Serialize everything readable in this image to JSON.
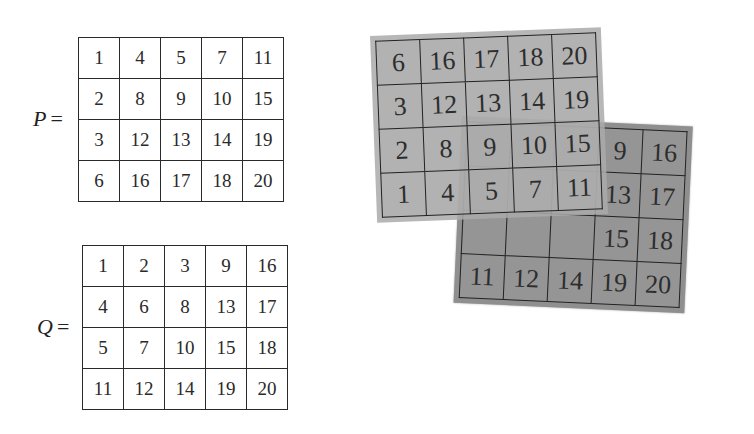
{
  "matrices": {
    "P": {
      "label": "P",
      "equals": "=",
      "rows": [
        [
          "1",
          "4",
          "5",
          "7",
          "11"
        ],
        [
          "2",
          "8",
          "9",
          "10",
          "15"
        ],
        [
          "3",
          "12",
          "13",
          "14",
          "19"
        ],
        [
          "6",
          "16",
          "17",
          "18",
          "20"
        ]
      ]
    },
    "Q": {
      "label": "Q",
      "equals": "=",
      "rows": [
        [
          "1",
          "2",
          "3",
          "9",
          "16"
        ],
        [
          "4",
          "6",
          "8",
          "13",
          "17"
        ],
        [
          "5",
          "7",
          "10",
          "15",
          "18"
        ],
        [
          "11",
          "12",
          "14",
          "19",
          "20"
        ]
      ]
    }
  },
  "overlay": {
    "front_flipped_P": {
      "rows": [
        [
          "6",
          "16",
          "17",
          "18",
          "20"
        ],
        [
          "3",
          "12",
          "13",
          "14",
          "19"
        ],
        [
          "2",
          "8",
          "9",
          "10",
          "15"
        ],
        [
          "1",
          "4",
          "5",
          "7",
          "11"
        ]
      ]
    },
    "back_Q": {
      "rows": [
        [
          "",
          "",
          "",
          "9",
          "16"
        ],
        [
          "",
          "",
          "",
          "13",
          "17"
        ],
        [
          "",
          "",
          "",
          "15",
          "18"
        ],
        [
          "11",
          "12",
          "14",
          "19",
          "20"
        ]
      ]
    },
    "colors": {
      "front_fill": "#aaaaaa",
      "back_fill": "#8f8f8f",
      "grid_line": "#222222"
    }
  }
}
